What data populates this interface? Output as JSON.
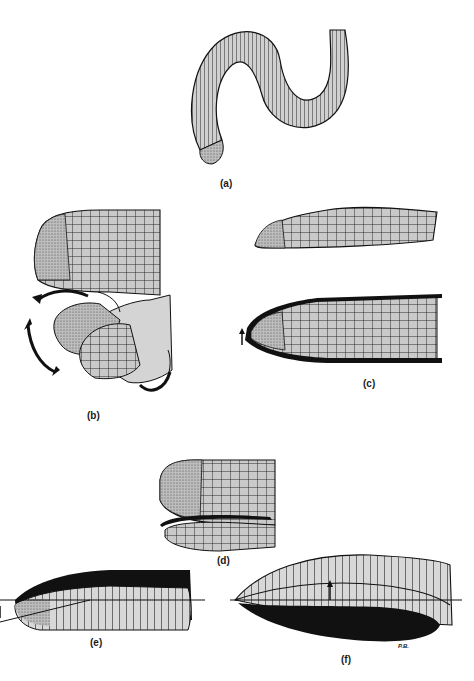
{
  "figure": {
    "panels": [
      {
        "id": "a",
        "label": "(a)",
        "subject": "whole-body-annulated-worm-lizard"
      },
      {
        "id": "b",
        "label": "(b)",
        "subject": "rounded-head-lateral-and-rotating-motion"
      },
      {
        "id": "c",
        "label": "(c)",
        "subject": "spade-head-lateral-and-dorsal"
      },
      {
        "id": "d",
        "label": "(d)",
        "subject": "keel-head-lateral"
      },
      {
        "id": "e",
        "label": "(e)",
        "subject": "body-section-dorsal-shading"
      },
      {
        "id": "f",
        "label": "(f)",
        "subject": "body-section-ventral-shading"
      }
    ],
    "signature": "P.B.",
    "icons": {
      "b_arrows": "curved-rotation-arrows",
      "c_arrow": "up-arrow",
      "f_arrow": "up-arrow"
    },
    "colors": {
      "ink": "#111111",
      "scale_fill": "#c9c9c9",
      "stipple_fill": "#a9a9a9",
      "body_fill": "#d6d6d6",
      "background": "#ffffff"
    }
  }
}
